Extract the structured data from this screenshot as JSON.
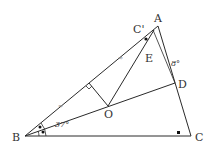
{
  "figure": {
    "type": "geometry-diagram",
    "points": {
      "A": {
        "label": "A",
        "x": 158,
        "y": 26
      },
      "B": {
        "label": "B",
        "x": 25,
        "y": 136
      },
      "C": {
        "label": "C",
        "x": 191,
        "y": 136
      },
      "C_prime": {
        "label": "C'",
        "x": 148,
        "y": 36
      },
      "D": {
        "label": "D",
        "x": 175,
        "y": 83
      },
      "E": {
        "label": "E",
        "x": 150,
        "y": 57
      },
      "O": {
        "label": "O",
        "x": 108,
        "y": 106
      },
      "F": {
        "label": "",
        "x": 89,
        "y": 83
      }
    },
    "angles": {
      "ABD": "37°",
      "CAD": "8°"
    },
    "marks": {
      "right_angle_C": "■",
      "equal_angle_dot": "•",
      "tick": "≈"
    },
    "colors": {
      "stroke": "#2a2a2a",
      "text": "#333333",
      "background": "#ffffff"
    }
  }
}
